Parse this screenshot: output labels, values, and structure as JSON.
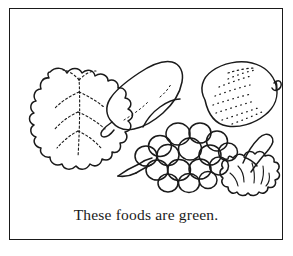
{
  "page": {
    "title": "These foods are green.",
    "background_color": "#ffffff",
    "ink_color": "#1a1a1a"
  },
  "frame": {
    "name": "picture-border",
    "stroke_color": "#1a1a1a"
  },
  "caption": {
    "text": "These foods are green."
  },
  "illustration": {
    "style": "black-and-white line drawing coloring page",
    "items": [
      {
        "name": "lettuce-leaf",
        "label": "Lettuce leaf",
        "position": "left",
        "details": "wavy scalloped outline with dotted interior veins"
      },
      {
        "name": "pear",
        "label": "Pear",
        "position": "upper-center-left",
        "details": "tilted pear with stem pointing lower-left"
      },
      {
        "name": "avocado",
        "label": "Avocado",
        "position": "upper-right",
        "details": "oval body with stippled dots and small curled stem at right"
      },
      {
        "name": "grapes",
        "label": "Bunch of grapes",
        "position": "lower-center",
        "details": "cluster of round grapes with bent stem to the left",
        "grape_count": 16
      },
      {
        "name": "broccoli",
        "label": "Broccoli",
        "position": "lower-right",
        "details": "bumpy floret head with thick stalk angled to upper right"
      }
    ]
  }
}
